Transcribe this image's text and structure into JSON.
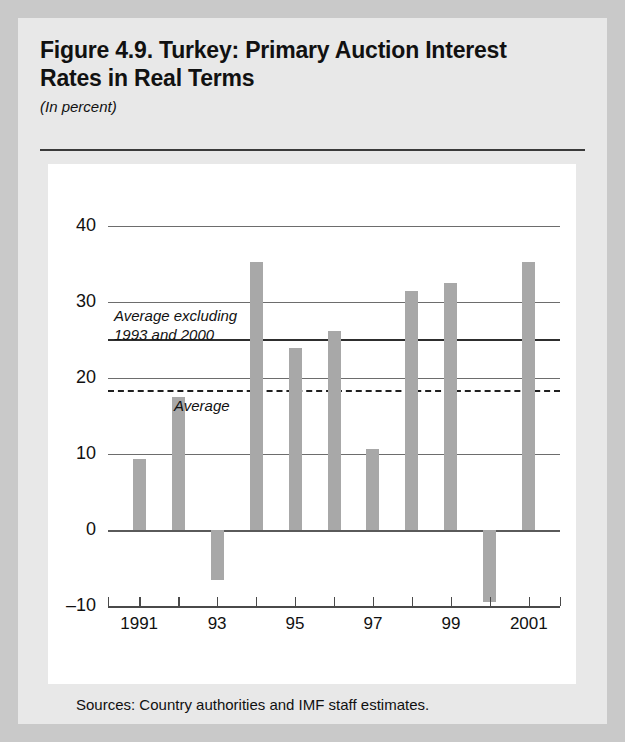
{
  "figure": {
    "title": "Figure 4.9. Turkey: Primary Auction Interest Rates in Real Terms",
    "subtitle": "(In percent)",
    "sources": "Sources: Country authorities and IMF staff estimates."
  },
  "annotations": {
    "avg_excluding": "Average excluding\n1993 and 2000",
    "average": "Average"
  },
  "chart_data": {
    "type": "bar",
    "title": "Figure 4.9. Turkey: Primary Auction Interest Rates in Real Terms",
    "subtitle": "(In percent)",
    "xlabel": "",
    "ylabel": "In percent",
    "ylim": [
      -10,
      40
    ],
    "yticks": [
      -10,
      0,
      10,
      20,
      30,
      40
    ],
    "ytick_labels": [
      "–10",
      "0",
      "10",
      "20",
      "30",
      "40"
    ],
    "grid": true,
    "legend": "none",
    "categories": [
      "1991",
      "1992",
      "1993",
      "1994",
      "1995",
      "1996",
      "1997",
      "1998",
      "1999",
      "2000",
      "2001"
    ],
    "xtick_labels": [
      "1991",
      "",
      "93",
      "",
      "95",
      "",
      "97",
      "",
      "99",
      "",
      "2001"
    ],
    "values": [
      9.3,
      17.5,
      -6.6,
      35.3,
      24.0,
      26.2,
      10.6,
      31.5,
      32.5,
      -9.5,
      35.3
    ],
    "reference_lines": [
      {
        "name": "Average excluding 1993 and 2000",
        "value": 25.1,
        "style": "solid"
      },
      {
        "name": "Average",
        "value": 18.4,
        "style": "dashed"
      }
    ],
    "bar_color": "#a8a8a8",
    "grid_color": "#6d6d6d",
    "axis_color": "#4a4a4a"
  }
}
